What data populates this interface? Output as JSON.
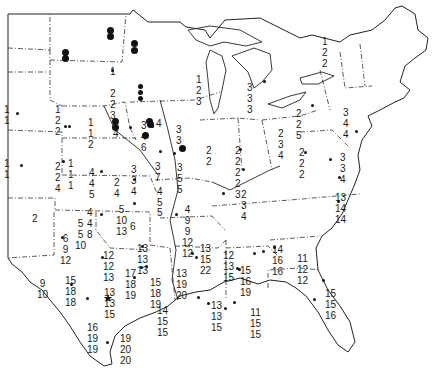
{
  "map": {
    "title": "",
    "region": "United States (central and eastern)",
    "labels": [
      {
        "x": 4,
        "y": 104,
        "text": "1\n1"
      },
      {
        "x": 55,
        "y": 104,
        "text": "1\n2\n2"
      },
      {
        "x": 88,
        "y": 117,
        "text": "1\n1\n2"
      },
      {
        "x": 110,
        "y": 28,
        "text": ""
      },
      {
        "x": 110,
        "y": 66,
        "text": "1"
      },
      {
        "x": 110,
        "y": 88,
        "text": "2\n2\n3"
      },
      {
        "x": 113,
        "y": 128,
        "text": "4"
      },
      {
        "x": 141,
        "y": 120,
        "text": "3\n4\n6"
      },
      {
        "x": 156,
        "y": 118,
        "text": "4"
      },
      {
        "x": 176,
        "y": 124,
        "text": "3\n3"
      },
      {
        "x": 196,
        "y": 74,
        "text": "1\n2\n3"
      },
      {
        "x": 247,
        "y": 82,
        "text": "3\n3\n3"
      },
      {
        "x": 235,
        "y": 145,
        "text": "2\n2\n2\n2\n3"
      },
      {
        "x": 206,
        "y": 145,
        "text": "2\n2"
      },
      {
        "x": 278,
        "y": 128,
        "text": "2\n3\n4"
      },
      {
        "x": 296,
        "y": 108,
        "text": "2\n2\n5"
      },
      {
        "x": 299,
        "y": 147,
        "text": "2\n2\n2"
      },
      {
        "x": 322,
        "y": 36,
        "text": "1\n2\n2"
      },
      {
        "x": 343,
        "y": 107,
        "text": "3\n4\n4"
      },
      {
        "x": 340,
        "y": 152,
        "text": "3\n3\n4"
      },
      {
        "x": 335,
        "y": 192,
        "text": "13\n14\n14"
      },
      {
        "x": 4,
        "y": 158,
        "text": "1\n1"
      },
      {
        "x": 55,
        "y": 161,
        "text": "2\n2\n4"
      },
      {
        "x": 68,
        "y": 158,
        "text": "1\n1\n1"
      },
      {
        "x": 89,
        "y": 167,
        "text": "4\n4\n5"
      },
      {
        "x": 114,
        "y": 177,
        "text": "2\n4"
      },
      {
        "x": 131,
        "y": 164,
        "text": "3\n3\n4"
      },
      {
        "x": 155,
        "y": 161,
        "text": "3\n7"
      },
      {
        "x": 157,
        "y": 186,
        "text": "4\n5"
      },
      {
        "x": 177,
        "y": 162,
        "text": "3\n5\n5"
      },
      {
        "x": 241,
        "y": 189,
        "text": "2\n3\n4"
      },
      {
        "x": 32,
        "y": 213,
        "text": "2"
      },
      {
        "x": 87,
        "y": 207,
        "text": "4\n4\n8"
      },
      {
        "x": 116,
        "y": 204,
        "text": "5\n10\n13"
      },
      {
        "x": 130,
        "y": 221,
        "text": "6"
      },
      {
        "x": 75,
        "y": 218,
        "text": "5\n5\n10"
      },
      {
        "x": 60,
        "y": 233,
        "text": "6\n9\n12"
      },
      {
        "x": 157,
        "y": 207,
        "text": "5"
      },
      {
        "x": 182,
        "y": 204,
        "text": "4\n9\n9\n12\n12"
      },
      {
        "x": 103,
        "y": 250,
        "text": "12\n12\n13"
      },
      {
        "x": 125,
        "y": 268,
        "text": "17\n18\n19"
      },
      {
        "x": 137,
        "y": 243,
        "text": "13\n13\n13"
      },
      {
        "x": 150,
        "y": 277,
        "text": "15\n18\n19"
      },
      {
        "x": 104,
        "y": 287,
        "text": "13\n13\n15"
      },
      {
        "x": 37,
        "y": 278,
        "text": "9\n10"
      },
      {
        "x": 65,
        "y": 275,
        "text": "15\n18\n18"
      },
      {
        "x": 87,
        "y": 322,
        "text": "16\n19\n19"
      },
      {
        "x": 120,
        "y": 333,
        "text": "19\n20\n20"
      },
      {
        "x": 176,
        "y": 268,
        "text": "13\n19\n20"
      },
      {
        "x": 157,
        "y": 305,
        "text": "14\n15\n15"
      },
      {
        "x": 200,
        "y": 243,
        "text": "13\n15\n22"
      },
      {
        "x": 223,
        "y": 250,
        "text": "12\n13\n15"
      },
      {
        "x": 240,
        "y": 265,
        "text": "15\n16\n19"
      },
      {
        "x": 211,
        "y": 300,
        "text": "13\n13\n15"
      },
      {
        "x": 250,
        "y": 307,
        "text": "11\n15\n15"
      },
      {
        "x": 272,
        "y": 244,
        "text": "14\n16\n16"
      },
      {
        "x": 297,
        "y": 253,
        "text": "11\n12\n12"
      },
      {
        "x": 325,
        "y": 288,
        "text": "15\n15\n16"
      }
    ],
    "small_dots": [
      [
        16,
        112
      ],
      [
        68,
        125
      ],
      [
        111,
        69
      ],
      [
        129,
        126
      ],
      [
        151,
        125
      ],
      [
        173,
        152
      ],
      [
        159,
        150
      ],
      [
        263,
        80
      ],
      [
        239,
        148
      ],
      [
        242,
        168
      ],
      [
        311,
        104
      ],
      [
        304,
        151
      ],
      [
        329,
        158
      ],
      [
        355,
        130
      ],
      [
        338,
        176
      ],
      [
        337,
        200
      ],
      [
        20,
        164
      ],
      [
        62,
        160
      ],
      [
        100,
        170
      ],
      [
        133,
        178
      ],
      [
        133,
        202
      ],
      [
        100,
        213
      ],
      [
        61,
        236
      ],
      [
        101,
        256
      ],
      [
        141,
        245
      ],
      [
        145,
        265
      ],
      [
        133,
        276
      ],
      [
        175,
        213
      ],
      [
        191,
        252
      ],
      [
        195,
        256
      ],
      [
        236,
        267
      ],
      [
        253,
        252
      ],
      [
        262,
        250
      ],
      [
        322,
        279
      ],
      [
        313,
        298
      ],
      [
        70,
        283
      ],
      [
        86,
        297
      ],
      [
        106,
        341
      ],
      [
        140,
        266
      ],
      [
        197,
        296
      ],
      [
        224,
        307
      ],
      [
        273,
        246
      ],
      [
        238,
        268
      ],
      [
        64,
        125
      ],
      [
        222,
        192
      ],
      [
        233,
        301
      ],
      [
        207,
        302
      ]
    ],
    "big_dots": [
      [
        62,
        49
      ],
      [
        62,
        55
      ],
      [
        107,
        27
      ],
      [
        107,
        33
      ],
      [
        131,
        40
      ],
      [
        131,
        47
      ],
      [
        146,
        118
      ],
      [
        147,
        121
      ],
      [
        142,
        132
      ],
      [
        179,
        145
      ],
      [
        112,
        118
      ],
      [
        112,
        124
      ]
    ],
    "stacked_dots": [
      [
        138,
        84
      ],
      [
        138,
        90
      ],
      [
        138,
        96
      ]
    ],
    "star": {
      "x": 103,
      "y": 293,
      "glyph": "★"
    }
  }
}
